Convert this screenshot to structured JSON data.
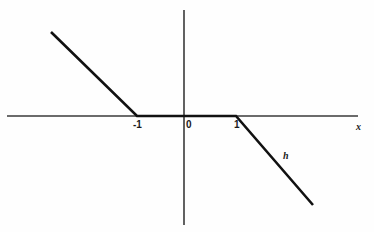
{
  "figure": {
    "title": "",
    "background_color": "#fefefe",
    "ink_color": "#1a1a1a",
    "axis_color": "#3a3a3a"
  },
  "labels": {
    "x_axis": "x",
    "curve": "h",
    "tick_neg_one": "-1",
    "tick_zero": "0",
    "tick_one": "1"
  },
  "chart_data": {
    "type": "line",
    "title": "",
    "xlabel": "x",
    "ylabel": "",
    "grid": false,
    "legend": "none",
    "annotations": [
      {
        "text": "h",
        "x": 1.85,
        "y": -0.82,
        "describes": "function-curve"
      },
      {
        "text": "x",
        "x": 3.55,
        "y": -0.1,
        "describes": "x-axis"
      }
    ],
    "xlim": [
      -3.55,
      3.55
    ],
    "ylim": [
      -2.25,
      2.1
    ],
    "xticks": [
      -1,
      0,
      1
    ],
    "xticklabels": [
      "-1",
      "0",
      "1"
    ],
    "yticks": [],
    "yticklabels": [],
    "series": [
      {
        "name": "h",
        "description": "piecewise linear function: decreasing for x<-1, zero on [-1,1], decreasing for x>1",
        "x": [
          -2.85,
          -1,
          1,
          2.75
        ],
        "y": [
          2.1,
          0,
          0,
          -2.25
        ],
        "segments": [
          {
            "from": [
              -2.85,
              2.1
            ],
            "to": [
              -1,
              0
            ],
            "slope": -1.135
          },
          {
            "from": [
              -1,
              0
            ],
            "to": [
              1,
              0
            ],
            "slope": 0
          },
          {
            "from": [
              1,
              0
            ],
            "to": [
              2.75,
              -2.25
            ],
            "slope": -1.286
          }
        ]
      }
    ]
  },
  "geometry": {
    "origin_px": {
      "x": 184,
      "y": 116
    },
    "x_axis_px": {
      "x1": 7,
      "y1": 116,
      "x2": 358,
      "y2": 116
    },
    "y_axis_px": {
      "x1": 184,
      "y1": 10,
      "x2": 184,
      "y2": 225
    },
    "curve_px": [
      {
        "x": 51,
        "y": 32
      },
      {
        "x": 137,
        "y": 116
      },
      {
        "x": 236,
        "y": 116
      },
      {
        "x": 313,
        "y": 205
      }
    ]
  }
}
